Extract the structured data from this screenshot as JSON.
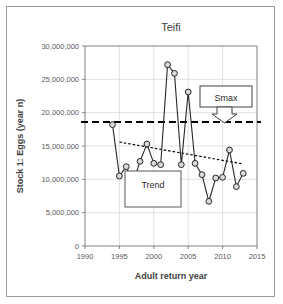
{
  "figure": {
    "border_color": "#9a9a9a",
    "background": "#ffffff"
  },
  "chart_data": {
    "type": "line",
    "title": "Teifi",
    "xlabel": "Adult return year",
    "ylabel": "Stock 1: Eggs (year n)",
    "xlim": [
      1990,
      2015
    ],
    "ylim": [
      0,
      30000000
    ],
    "xticks": [
      1990,
      1995,
      2000,
      2005,
      2010,
      2015
    ],
    "xtick_labels": [
      "1990",
      "1995",
      "2000",
      "2005",
      "2010",
      "2015"
    ],
    "yticks": [
      0,
      5000000,
      10000000,
      15000000,
      20000000,
      25000000,
      30000000
    ],
    "ytick_labels": [
      "0",
      "5,000,000",
      "10,000,000",
      "15,000,000",
      "20,000,000",
      "25,000,000",
      "30,000,000"
    ],
    "grid": true,
    "legend": "none",
    "marker": "circle",
    "marker_fill": "#d9d9d9",
    "marker_edge": "#262626",
    "line_color": "#262626",
    "x": [
      1994,
      1995,
      1996,
      1997,
      1998,
      1999,
      2000,
      2001,
      2002,
      2003,
      2004,
      2005,
      2006,
      2007,
      2008,
      2009,
      2010,
      2011,
      2012,
      2013
    ],
    "values": [
      18200000,
      10500000,
      11900000,
      9500000,
      12700000,
      15300000,
      12400000,
      12200000,
      27200000,
      25900000,
      12200000,
      23100000,
      12400000,
      10700000,
      6700000,
      10200000,
      10300000,
      14400000,
      8900000,
      10900000
    ],
    "series": [
      {
        "name": "Stock 1: Eggs (year n)",
        "values": [
          18200000,
          10500000,
          11900000,
          9500000,
          12700000,
          15300000,
          12400000,
          12200000,
          27200000,
          25900000,
          12200000,
          23100000,
          12400000,
          10700000,
          6700000,
          10200000,
          10300000,
          14400000,
          8900000,
          10900000
        ]
      }
    ],
    "reference_lines": [
      {
        "name": "Smax",
        "label": "Smax",
        "orientation": "horizontal",
        "value": 18600000,
        "style": "dashed",
        "color": "#000000"
      }
    ],
    "trend_line": {
      "name": "Trend",
      "label": "Trend",
      "style": "dotted",
      "color": "#000000",
      "x_start": 1995,
      "y_start": 15600000,
      "x_end": 2013,
      "y_end": 12300000
    },
    "annotations": [
      {
        "name": "smax-callout",
        "label": "Smax",
        "shape": "box-with-down-arrow",
        "points_to_value": 18600000
      },
      {
        "name": "trend-callout",
        "label": "Trend",
        "shape": "box"
      }
    ]
  }
}
